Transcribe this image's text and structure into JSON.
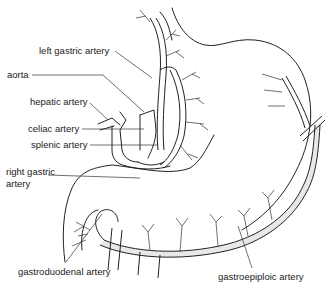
{
  "figure": {
    "type": "anatomical line diagram",
    "labels": {
      "left_gastric": "left gastric artery",
      "aorta": "aorta",
      "hepatic": "hepatic artery",
      "celiac": "celiac artery",
      "splenic": "splenic artery",
      "right_gastric_1": "right gastric",
      "right_gastric_2": "artery",
      "gastroduodenal": "gastroduodenal artery",
      "gastroepiploic": "gastroepiploic artery"
    },
    "colors": {
      "line": "#222222",
      "background": "#ffffff"
    }
  }
}
